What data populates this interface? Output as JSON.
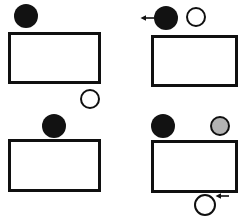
{
  "figure": {
    "title": "",
    "background_color": "#ffffff",
    "width": 247,
    "height": 219,
    "stroke_color": "#101010",
    "colors": {
      "black_fill": "#121212",
      "white_fill": "#ffffff",
      "gray_fill": "#b3b3b3",
      "outline": "#101010"
    },
    "layout": "2x2 grid of panels, each panel shows a wide rectangle (box) with circular tokens placed above or below it",
    "panels": [
      {
        "id": "panel-top-left",
        "position": "top-left",
        "label": "",
        "rect": {
          "x": 8,
          "y": 32,
          "width": 93,
          "height": 52,
          "stroke": 3,
          "fill": "#ffffff"
        },
        "tokens": [
          {
            "name": "black-circle",
            "fill": "black",
            "cx": 26,
            "cy": 16,
            "r": 12,
            "arrow": "none",
            "position_desc": "above rectangle, left side"
          },
          {
            "name": "white-circle",
            "fill": "white",
            "cx": 90,
            "cy": 99,
            "r": 10,
            "arrow": "none",
            "position_desc": "below rectangle, right side"
          }
        ]
      },
      {
        "id": "panel-top-right",
        "position": "top-right",
        "label": "",
        "rect": {
          "x": 151,
          "y": 35,
          "width": 87,
          "height": 52,
          "stroke": 3,
          "fill": "#ffffff"
        },
        "tokens": [
          {
            "name": "black-circle",
            "fill": "black",
            "cx": 166,
            "cy": 18,
            "r": 12,
            "arrow": "left",
            "position_desc": "above rectangle, left side, with leftward arrow"
          },
          {
            "name": "white-circle",
            "fill": "white",
            "cx": 196,
            "cy": 17,
            "r": 10,
            "arrow": "none",
            "position_desc": "above rectangle, right of the black circle"
          }
        ]
      },
      {
        "id": "panel-bottom-left",
        "position": "bottom-left",
        "label": "",
        "rect": {
          "x": 8,
          "y": 139,
          "width": 93,
          "height": 53,
          "stroke": 3,
          "fill": "#ffffff"
        },
        "tokens": [
          {
            "name": "black-circle",
            "fill": "black",
            "cx": 54,
            "cy": 126,
            "r": 12,
            "arrow": "none",
            "position_desc": "above rectangle, centered"
          }
        ]
      },
      {
        "id": "panel-bottom-right",
        "position": "bottom-right",
        "label": "",
        "rect": {
          "x": 151,
          "y": 140,
          "width": 87,
          "height": 53,
          "stroke": 3,
          "fill": "#ffffff"
        },
        "tokens": [
          {
            "name": "black-circle",
            "fill": "black",
            "cx": 163,
            "cy": 126,
            "r": 12,
            "arrow": "none",
            "position_desc": "above rectangle, left side"
          },
          {
            "name": "gray-circle",
            "fill": "gray",
            "cx": 220,
            "cy": 126,
            "r": 10,
            "arrow": "none",
            "position_desc": "above rectangle, right side"
          },
          {
            "name": "white-circle",
            "fill": "white",
            "cx": 205,
            "cy": 205,
            "r": 11,
            "arrow": "left",
            "position_desc": "below rectangle, with leftward arrow at upper right"
          }
        ]
      }
    ],
    "arrows": [
      {
        "id": "arrow-top-right",
        "direction": "left",
        "x": 143,
        "y": 18,
        "length": 13
      },
      {
        "id": "arrow-bottom-right",
        "direction": "left",
        "x": 218,
        "y": 196,
        "length": 13
      }
    ]
  }
}
